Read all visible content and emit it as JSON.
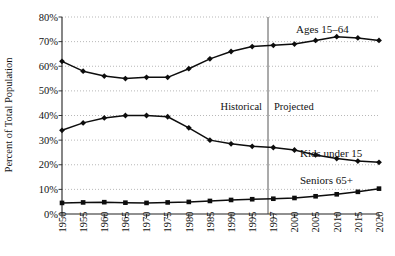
{
  "chart_data": {
    "type": "line",
    "title": "",
    "xlabel": "",
    "ylabel": "Percent of Total Population",
    "ylim": [
      0,
      80
    ],
    "ytick_labels": [
      "0%",
      "10%",
      "20%",
      "30%",
      "40%",
      "50%",
      "60%",
      "70%",
      "80%"
    ],
    "ytick_values": [
      0,
      10,
      20,
      30,
      40,
      50,
      60,
      70,
      80
    ],
    "grid": true,
    "legend_position": "inline-annotations",
    "categories": [
      "1950",
      "1955",
      "1960",
      "1965",
      "1970",
      "1975",
      "1980",
      "1985",
      "1990",
      "1995",
      "1997",
      "2000",
      "2005",
      "2010",
      "2015",
      "2020"
    ],
    "x": [
      1950,
      1955,
      1960,
      1965,
      1970,
      1975,
      1980,
      1985,
      1990,
      1995,
      1997,
      2000,
      2005,
      2010,
      2015,
      2020
    ],
    "series": [
      {
        "name": "Ages 15-64",
        "label": "Ages 15–64",
        "marker": "diamond",
        "values": [
          62,
          58,
          56,
          55,
          55.5,
          55.5,
          59,
          63,
          66,
          68,
          68.5,
          69,
          70.5,
          72,
          71.5,
          70.5
        ]
      },
      {
        "name": "Kids under 15",
        "label": "Kids under 15",
        "marker": "diamond",
        "values": [
          34,
          37,
          39,
          40,
          40,
          39.5,
          35,
          30,
          28.5,
          27.5,
          27,
          26,
          24,
          22.5,
          21.5,
          21
        ]
      },
      {
        "name": "Seniors 65+",
        "label": "Seniors 65+",
        "marker": "square",
        "values": [
          4.5,
          4.7,
          4.8,
          4.6,
          4.5,
          4.7,
          4.9,
          5.3,
          5.7,
          6,
          6.2,
          6.5,
          7.2,
          8,
          9,
          10.3
        ]
      }
    ],
    "annotations": [
      {
        "name": "historical",
        "text": "Historical"
      },
      {
        "name": "projected",
        "text": "Projected"
      }
    ],
    "divider": {
      "value": 1997,
      "label": "1997"
    }
  }
}
